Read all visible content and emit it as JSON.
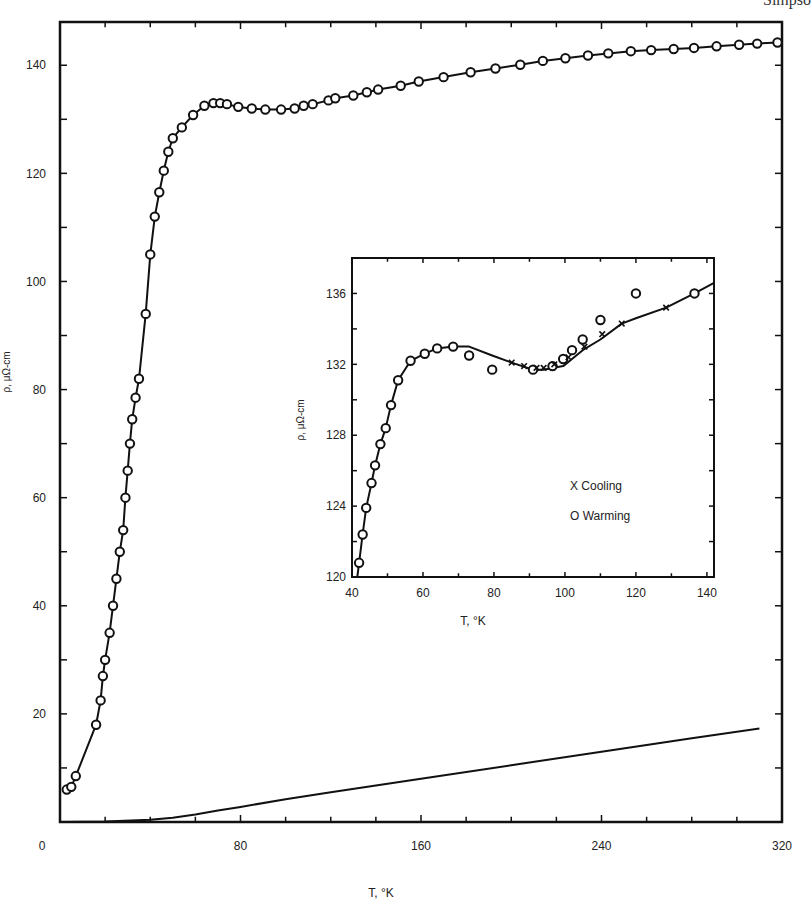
{
  "page": {
    "corner_text": "Simpso"
  },
  "chart_data": [
    {
      "id": "main",
      "type": "line",
      "title": "",
      "xlabel": "T, °K",
      "ylabel": "ρ, μΩ-cm",
      "xlim": [
        0,
        320
      ],
      "ylim": [
        0,
        148
      ],
      "x_ticks": [
        0,
        80,
        160,
        240,
        320
      ],
      "x_tick_labels": [
        "0",
        "80",
        "160",
        "240",
        "320"
      ],
      "x_minor_step": 20,
      "y_ticks": [
        20,
        40,
        60,
        80,
        100,
        120,
        140
      ],
      "y_tick_labels": [
        "20",
        "40",
        "60",
        "80",
        "100",
        "120",
        "140"
      ],
      "y_minor_step": 10,
      "grid": false,
      "series": [
        {
          "name": "Resistivity (circles)",
          "marker": "open-circle",
          "x": [
            3,
            5,
            7,
            16,
            18,
            19,
            20,
            22,
            23.5,
            25,
            26.5,
            28,
            29,
            30,
            31,
            32,
            33.5,
            35,
            38,
            40,
            42,
            44,
            46,
            48,
            50,
            54,
            59,
            64,
            68,
            71,
            74,
            79,
            85,
            91,
            98,
            104,
            108,
            112,
            119,
            122,
            130,
            136,
            141,
            151,
            159,
            170,
            182,
            193,
            204,
            214,
            224,
            234,
            243,
            253,
            262,
            272,
            281,
            291,
            301,
            309,
            318
          ],
          "y": [
            6,
            6.5,
            8.5,
            18,
            22.5,
            27,
            30,
            35,
            40,
            45,
            50,
            54,
            60,
            65,
            70,
            74.5,
            78.5,
            82,
            94,
            105,
            112,
            116.5,
            120.5,
            124,
            126.5,
            128.5,
            130.8,
            132.5,
            133,
            133,
            132.8,
            132.3,
            132,
            131.8,
            131.8,
            132,
            132.5,
            132.8,
            133.5,
            133.9,
            134.4,
            135,
            135.5,
            136.2,
            137,
            137.8,
            138.7,
            139.4,
            140.1,
            140.8,
            141.3,
            141.8,
            142.2,
            142.6,
            142.8,
            143,
            143.2,
            143.5,
            143.8,
            144,
            144.2
          ]
        },
        {
          "name": "Lower reference curve",
          "marker": "none",
          "x": [
            0,
            20,
            40,
            50,
            60,
            70,
            80,
            100,
            120,
            160,
            200,
            240,
            280,
            310
          ],
          "y": [
            0,
            0.1,
            0.4,
            0.8,
            1.4,
            2.1,
            2.8,
            4.2,
            5.5,
            8.0,
            10.5,
            13.0,
            15.5,
            17.3
          ]
        }
      ]
    },
    {
      "id": "inset",
      "type": "line",
      "title": "",
      "xlabel": "T, °K",
      "ylabel": "ρ, μΩ-cm",
      "xlim": [
        40,
        142
      ],
      "ylim": [
        120,
        138
      ],
      "x_ticks": [
        40,
        60,
        80,
        100,
        120,
        140
      ],
      "x_tick_labels": [
        "40",
        "60",
        "80",
        "100",
        "120",
        "140"
      ],
      "x_minor_step": 10,
      "y_ticks": [
        120,
        124,
        128,
        132,
        136
      ],
      "y_tick_labels": [
        "120",
        "124",
        "128",
        "132",
        "136"
      ],
      "y_minor_step": 2,
      "grid": false,
      "legend": {
        "position": "lower-right-inside",
        "entries": [
          {
            "marker": "X",
            "label": "Cooling"
          },
          {
            "marker": "O",
            "label": "Warming"
          }
        ]
      },
      "series": [
        {
          "name": "Warming",
          "marker": "O",
          "x": [
            42,
            43,
            44,
            45.5,
            46.5,
            48,
            49.5,
            51,
            53,
            56.5,
            60.5,
            64,
            68.5,
            73,
            79.5,
            91,
            96.5,
            99.5,
            102,
            105,
            110,
            120,
            136.5
          ],
          "y": [
            120.8,
            122.4,
            123.9,
            125.3,
            126.3,
            127.5,
            128.4,
            129.7,
            131.1,
            132.2,
            132.6,
            132.9,
            133.0,
            132.5,
            131.7,
            131.7,
            131.9,
            132.3,
            132.8,
            133.4,
            134.5,
            136.0,
            136.0
          ],
          "x_clean": [
            42,
            43,
            44,
            45.5,
            46.5,
            48,
            49.5,
            51,
            53,
            56.5,
            60.5,
            64,
            68.5,
            73,
            79.5,
            91,
            96.5,
            99.5,
            102,
            105,
            110,
            120,
            136.5
          ],
          "y_clean": [
            120.8,
            122.4,
            123.9,
            125.3,
            126.3,
            127.5,
            128.4,
            129.7,
            131.1,
            132.2,
            132.6,
            132.9,
            133.0,
            132.5,
            131.7,
            131.7,
            131.9,
            132.3,
            132.8,
            133.4,
            134.5,
            136.0,
            136.0
          ]
        },
        {
          "name": "Cooling",
          "marker": "X",
          "x": [
            85,
            88.5,
            92,
            94,
            97,
            101,
            105.5,
            110.5,
            116,
            128.5
          ],
          "y": [
            132.1,
            131.9,
            131.8,
            131.8,
            132.0,
            132.4,
            133.0,
            133.7,
            134.3,
            135.2
          ]
        }
      ],
      "curve": {
        "x": [
          41.5,
          42,
          43,
          44,
          45.5,
          46.5,
          48,
          49.5,
          51,
          53,
          56.5,
          60.5,
          64,
          68.5,
          73,
          79.5,
          85,
          91,
          94,
          96.5,
          99.5,
          102,
          105,
          110,
          116,
          120,
          128.5,
          136.5,
          142
        ],
        "y": [
          120,
          120.8,
          122.4,
          123.9,
          125.3,
          126.3,
          127.5,
          128.4,
          129.7,
          131.1,
          132.2,
          132.6,
          132.9,
          133.0,
          133.0,
          132.5,
          132.1,
          131.7,
          131.7,
          131.8,
          131.9,
          132.3,
          132.8,
          133.4,
          134.3,
          134.6,
          135.2,
          136.0,
          136.6
        ]
      }
    }
  ]
}
